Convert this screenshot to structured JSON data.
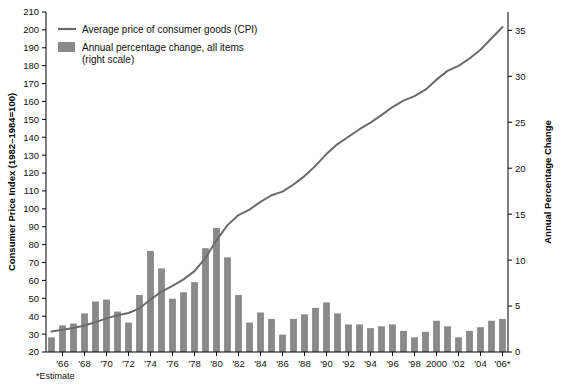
{
  "chart_data": {
    "type": "bar",
    "title": "",
    "subtitle": "",
    "xlabel": "",
    "ylabel": "Consumer Price Index (1982–1984=100)",
    "y2label": "Annual Percentage Change",
    "grid": false,
    "legend_position": "top-left",
    "ylim": [
      20,
      210
    ],
    "y2lim": [
      0,
      37
    ],
    "yticks": [
      20,
      30,
      40,
      50,
      60,
      70,
      80,
      90,
      100,
      110,
      120,
      130,
      140,
      150,
      160,
      170,
      180,
      190,
      200,
      210
    ],
    "y2ticks": [
      0,
      5,
      10,
      15,
      20,
      25,
      30,
      35
    ],
    "x": [
      1965,
      1966,
      1967,
      1968,
      1969,
      1970,
      1971,
      1972,
      1973,
      1974,
      1975,
      1976,
      1977,
      1978,
      1979,
      1980,
      1981,
      1982,
      1983,
      1984,
      1985,
      1986,
      1987,
      1988,
      1989,
      1990,
      1991,
      1992,
      1993,
      1994,
      1995,
      1996,
      1997,
      1998,
      1999,
      2000,
      2001,
      2002,
      2003,
      2004,
      2005,
      2006
    ],
    "xtick_labels": [
      "'66",
      "'68",
      "'70",
      "'72",
      "'74",
      "'76",
      "'78",
      "'80",
      "'82",
      "'84",
      "'86",
      "'88",
      "'90",
      "'92",
      "'94",
      "'96",
      "'98",
      "2000",
      "'02",
      "'04",
      "'06*"
    ],
    "xtick_years": [
      1966,
      1968,
      1970,
      1972,
      1974,
      1976,
      1978,
      1980,
      1982,
      1984,
      1986,
      1988,
      1990,
      1992,
      1994,
      1996,
      1998,
      2000,
      2002,
      2004,
      2006
    ],
    "series": [
      {
        "name": "Annual percentage change, all items (right scale)",
        "type": "bar",
        "axis": "right",
        "color": "#8a8a8a",
        "values": [
          1.6,
          2.9,
          3.1,
          4.2,
          5.5,
          5.7,
          4.4,
          3.2,
          6.2,
          11.0,
          9.1,
          5.8,
          6.5,
          7.6,
          11.3,
          13.5,
          10.3,
          6.2,
          3.2,
          4.3,
          3.6,
          1.9,
          3.6,
          4.1,
          4.8,
          5.4,
          4.2,
          3.0,
          3.0,
          2.6,
          2.8,
          3.0,
          2.3,
          1.6,
          2.2,
          3.4,
          2.8,
          1.6,
          2.3,
          2.7,
          3.4,
          3.6
        ]
      },
      {
        "name": "Average price of consumer goods (CPI)",
        "type": "line",
        "axis": "left",
        "color": "#6b6b6b",
        "values": [
          31.5,
          32.4,
          33.4,
          34.8,
          36.7,
          38.8,
          40.5,
          41.8,
          44.4,
          49.3,
          53.8,
          56.9,
          60.6,
          65.2,
          72.6,
          82.4,
          90.9,
          96.5,
          99.6,
          103.9,
          107.6,
          109.6,
          113.6,
          118.3,
          124.0,
          130.7,
          136.2,
          140.3,
          144.5,
          148.2,
          152.4,
          156.9,
          160.5,
          163.0,
          166.6,
          172.2,
          177.1,
          179.9,
          184.0,
          188.9,
          195.3,
          201.6
        ]
      }
    ],
    "footnote": "*Estimate"
  },
  "legend": {
    "line_label": "Average price of consumer goods (CPI)",
    "bar_label_line1": "Annual percentage change, all items",
    "bar_label_line2": "(right scale)"
  },
  "axes": {
    "left_title": "Consumer Price Index (1982–1984=100)",
    "right_title": "Annual Percentage Change"
  },
  "footnote": "*Estimate",
  "colors": {
    "bar": "#8a8a8a",
    "line": "#6b6b6b",
    "axis": "#000000",
    "background": "#ffffff"
  }
}
